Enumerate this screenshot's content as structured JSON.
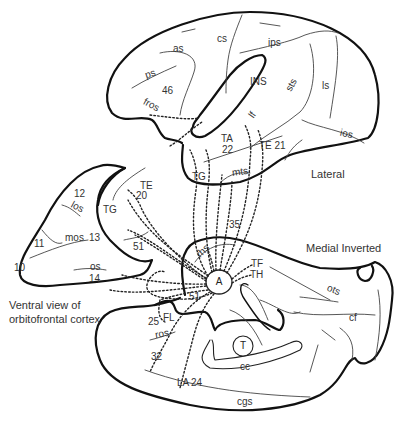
{
  "views": {
    "lateral": {
      "caption": "Lateral"
    },
    "medial": {
      "caption": "Medial Inverted"
    },
    "ventral": {
      "caption_line1": "Ventral view of",
      "caption_line2": "orbitofrontal cortex"
    }
  },
  "center": {
    "amygdala": "A",
    "thalamus": "T"
  },
  "lateral_labels": {
    "as": "as",
    "cs": "cs",
    "ips": "ips",
    "ps": "ps",
    "a46": "46",
    "ins": "INS",
    "sts": "sts",
    "ls": "ls",
    "fros": "fros",
    "lf": "lf",
    "ios": "ios",
    "ta": "TA",
    "a22": "22",
    "te21": "TE 21",
    "tg": "TG",
    "mts": "mts"
  },
  "ventral_labels": {
    "a12": "12",
    "los": "los",
    "tg": "TG",
    "te": "TE",
    "a20": "20",
    "a11": "11",
    "mos": "mos",
    "a13": "13",
    "a51": "51",
    "a10": "10",
    "os": "os",
    "a14": "14"
  },
  "medial_labels": {
    "a35": "35",
    "rhs": "rhs",
    "tf": "TF",
    "th": "TH",
    "a51": "51",
    "ots": "ots",
    "cf": "cf",
    "a25": "25",
    "fl": "FL",
    "ros": "ros",
    "a32": "32",
    "cc": "cc",
    "la": "LA",
    "a24": "24",
    "cgs": "cgs"
  }
}
